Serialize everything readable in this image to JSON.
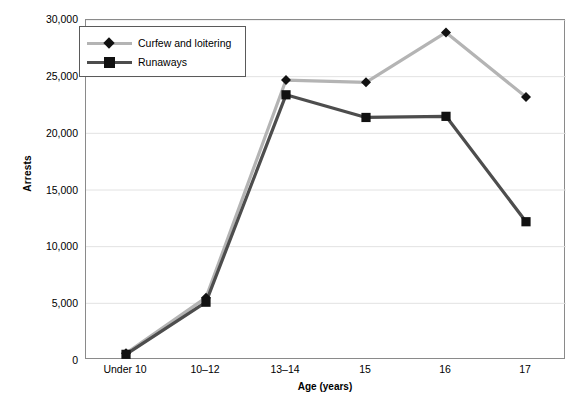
{
  "chart_data": {
    "type": "line",
    "title": "",
    "subtitle": "",
    "xlabel": "Age (years)",
    "ylabel": "Arrests",
    "categories": [
      "Under 10",
      "10–12",
      "13–14",
      "15",
      "16",
      "17"
    ],
    "ylim": [
      0,
      30000
    ],
    "yticks": [
      0,
      5000,
      10000,
      15000,
      20000,
      25000,
      30000
    ],
    "ytick_labels": [
      "0",
      "5,000",
      "10,000",
      "15,000",
      "20,000",
      "25,000",
      "30,000"
    ],
    "grid": "horizontal",
    "legend_position": "top-left-inside",
    "series": [
      {
        "name": "Curfew and loitering",
        "color": "#b4b4b4",
        "marker": "diamond",
        "values": [
          600,
          5500,
          24700,
          24500,
          28900,
          23200
        ]
      },
      {
        "name": "Runaways",
        "color": "#4d4d4d",
        "marker": "square",
        "values": [
          500,
          5100,
          23400,
          21400,
          21500,
          12200
        ]
      }
    ]
  },
  "axes": {
    "y_title": "Arrests",
    "x_title": "Age (years)"
  },
  "legend": {
    "entries": [
      {
        "label": "Curfew and loitering"
      },
      {
        "label": "Runaways"
      }
    ]
  },
  "colors": {
    "series_curfew": "#b4b4b4",
    "series_runaways": "#4d4d4d",
    "marker": "#111111",
    "grid": "#e2e2e2",
    "frame": "#8a8a8a"
  }
}
